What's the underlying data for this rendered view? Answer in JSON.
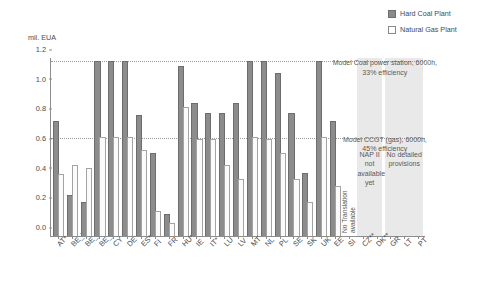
{
  "chart_data": {
    "type": "bar",
    "title": "",
    "ylabel": "mil. EUA",
    "xlabel": "",
    "ylim": [
      0.0,
      1.2
    ],
    "yticks": [
      "0.0",
      "0.2",
      "0.4",
      "0.6",
      "0.8",
      "1.0",
      "1.2"
    ],
    "grid": false,
    "legend_position": "top-right",
    "categories": [
      "AT*",
      "BE_W",
      "BE_F",
      "BE_B",
      "CY",
      "DE",
      "ES*",
      "FI",
      "FR",
      "HU*",
      "IE",
      "IT*",
      "LU",
      "LV",
      "MT",
      "NL",
      "PL",
      "SE",
      "SK",
      "UK",
      "EE",
      "SI",
      "CZ**",
      "DK**",
      "GR",
      "LT",
      "PT"
    ],
    "series": [
      {
        "name": "Hard Coal Plant",
        "color": "#8c8c8c",
        "values": [
          0.77,
          0.27,
          0.22,
          1.17,
          1.17,
          1.17,
          0.81,
          0.55,
          0.14,
          1.14,
          0.89,
          0.82,
          0.82,
          0.89,
          1.17,
          1.17,
          1.09,
          0.82,
          0.42,
          1.17,
          0.77,
          null,
          null,
          null,
          null,
          null,
          null
        ]
      },
      {
        "name": "Natural Gas Plant",
        "color": "#fbfbfb",
        "values": [
          0.41,
          0.47,
          0.45,
          0.66,
          0.66,
          0.66,
          0.57,
          0.16,
          0.08,
          0.86,
          0.65,
          0.65,
          0.47,
          0.38,
          0.66,
          0.65,
          0.55,
          0.38,
          0.22,
          0.66,
          0.33,
          null,
          null,
          null,
          null,
          null,
          null
        ]
      }
    ],
    "reference_lines": [
      {
        "value": 1.17,
        "label": "Model Coal power station, 6000h,\n33% efficiency",
        "style": "dotted"
      },
      {
        "value": 0.655,
        "label": "Model CCGT (gas), 6000h,\n45% efficiency",
        "style": "dotted"
      }
    ],
    "annotations": [
      {
        "text": "No Translation\navailable",
        "orientation": "vertical",
        "near_category": "SI"
      },
      {
        "text": "NAP II\nnot\navailable\nyet",
        "orientation": "horizontal",
        "panel": 1
      },
      {
        "text": "No detailed\nprovisions",
        "orientation": "horizontal",
        "panel": 2
      }
    ],
    "shaded_panels": [
      {
        "label": "NAP II not available yet",
        "from_category": "CZ**",
        "to_category": "DK**"
      },
      {
        "label": "No detailed provisions",
        "from_category": "GR",
        "to_category": "PT"
      }
    ]
  },
  "legend": {
    "items": [
      {
        "label": "Hard Coal Plant",
        "marker": "filled-square"
      },
      {
        "label": "Natural Gas Plant",
        "marker": "empty-square"
      }
    ]
  },
  "axis": {
    "y_title": "mil. EUA"
  },
  "notes": {
    "coal_model": "Model Coal power station, 6000h,\n33% efficiency",
    "gas_model": "Model CCGT (gas), 6000h,\n45% efficiency",
    "no_translation": "No Translation\navailable",
    "nap_unavailable": "NAP II\nnot\navailable\nyet",
    "no_provisions": "No detailed\nprovisions"
  }
}
